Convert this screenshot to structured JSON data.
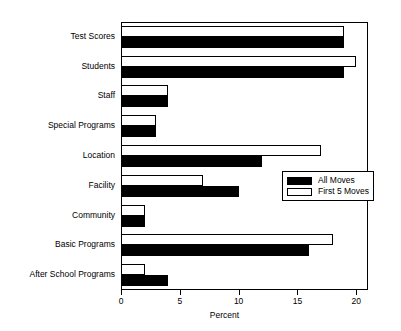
{
  "chart_data": {
    "type": "bar",
    "orientation": "horizontal",
    "title": "",
    "xlabel": "Percent",
    "ylabel": "",
    "xlim": [
      0,
      21
    ],
    "xticks": [
      0,
      5,
      10,
      15,
      20
    ],
    "xtick_labels": [
      "0",
      "5",
      "10",
      "15",
      "20"
    ],
    "grid": false,
    "legend_position": "center-right",
    "categories": [
      "Test Scores",
      "Students",
      "Staff",
      "Special Programs",
      "Location",
      "Facility",
      "Community",
      "Basic Programs",
      "After School Programs"
    ],
    "series": [
      {
        "name": "All Moves",
        "color": "#000000",
        "style": "filled",
        "values": [
          19,
          19,
          4,
          3,
          12,
          10,
          2,
          16,
          4
        ]
      },
      {
        "name": "First 5 Moves",
        "color": "#ffffff",
        "style": "hollow",
        "values": [
          19,
          20,
          4,
          3,
          17,
          7,
          2,
          18,
          2
        ]
      }
    ]
  },
  "legend": {
    "entries": [
      {
        "label": "All Moves",
        "swatch": "filled"
      },
      {
        "label": "First 5 Moves",
        "swatch": "hollow"
      }
    ]
  }
}
